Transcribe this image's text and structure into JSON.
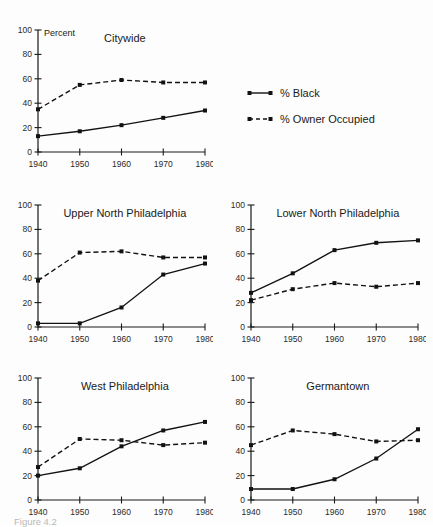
{
  "figure": {
    "caption": "Figure 4.2",
    "y_axis_name": "Percent"
  },
  "legend": {
    "position": "top-right",
    "items": [
      {
        "label": "% Black",
        "style": "solid",
        "marker": "square",
        "color": "#121212"
      },
      {
        "label": "% Owner Occupied",
        "style": "dashed",
        "marker": "square",
        "color": "#121212"
      }
    ]
  },
  "chart_data": [
    {
      "type": "line",
      "title": "Citywide",
      "xlabel": "",
      "ylabel": "Percent",
      "x": [
        1940,
        1950,
        1960,
        1970,
        1980
      ],
      "xlim": [
        1940,
        1980
      ],
      "ylim": [
        0,
        100
      ],
      "yticks": [
        0,
        20,
        40,
        60,
        80,
        100
      ],
      "xticks": [
        1940,
        1950,
        1960,
        1970,
        1980
      ],
      "grid": false,
      "series": [
        {
          "name": "% Black",
          "style": "solid",
          "values": [
            13,
            17,
            22,
            28,
            34
          ]
        },
        {
          "name": "% Owner Occupied",
          "style": "dashed",
          "values": [
            35,
            55,
            59,
            57,
            57
          ]
        }
      ]
    },
    {
      "type": "line",
      "title": "Upper North Philadelphia",
      "xlabel": "",
      "ylabel": "",
      "x": [
        1940,
        1950,
        1960,
        1970,
        1980
      ],
      "xlim": [
        1940,
        1980
      ],
      "ylim": [
        0,
        100
      ],
      "yticks": [
        0,
        20,
        40,
        60,
        80,
        100
      ],
      "xticks": [
        1940,
        1950,
        1960,
        1970,
        1980
      ],
      "grid": false,
      "series": [
        {
          "name": "% Black",
          "style": "solid",
          "values": [
            3,
            3,
            16,
            43,
            52
          ]
        },
        {
          "name": "% Owner Occupied",
          "style": "dashed",
          "values": [
            38,
            61,
            62,
            57,
            57
          ]
        }
      ]
    },
    {
      "type": "line",
      "title": "Lower North Philadelphia",
      "xlabel": "",
      "ylabel": "",
      "x": [
        1940,
        1950,
        1960,
        1970,
        1980
      ],
      "xlim": [
        1940,
        1980
      ],
      "ylim": [
        0,
        100
      ],
      "yticks": [
        0,
        20,
        40,
        60,
        80,
        100
      ],
      "xticks": [
        1940,
        1950,
        1960,
        1970,
        1980
      ],
      "grid": false,
      "series": [
        {
          "name": "% Black",
          "style": "solid",
          "values": [
            28,
            44,
            63,
            69,
            71
          ]
        },
        {
          "name": "% Owner Occupied",
          "style": "dashed",
          "values": [
            22,
            31,
            36,
            33,
            36
          ]
        }
      ]
    },
    {
      "type": "line",
      "title": "West Philadelphia",
      "xlabel": "",
      "ylabel": "",
      "x": [
        1940,
        1950,
        1960,
        1970,
        1980
      ],
      "xlim": [
        1940,
        1980
      ],
      "ylim": [
        0,
        100
      ],
      "yticks": [
        0,
        20,
        40,
        60,
        80,
        100
      ],
      "xticks": [
        1940,
        1950,
        1960,
        1970,
        1980
      ],
      "grid": false,
      "series": [
        {
          "name": "% Black",
          "style": "solid",
          "values": [
            20,
            26,
            44,
            57,
            64
          ]
        },
        {
          "name": "% Owner Occupied",
          "style": "dashed",
          "values": [
            27,
            50,
            49,
            45,
            47
          ]
        }
      ]
    },
    {
      "type": "line",
      "title": "Germantown",
      "xlabel": "",
      "ylabel": "",
      "x": [
        1940,
        1950,
        1960,
        1970,
        1980
      ],
      "xlim": [
        1940,
        1980
      ],
      "ylim": [
        0,
        100
      ],
      "yticks": [
        0,
        20,
        40,
        60,
        80,
        100
      ],
      "xticks": [
        1940,
        1950,
        1960,
        1970,
        1980
      ],
      "grid": false,
      "series": [
        {
          "name": "% Black",
          "style": "solid",
          "values": [
            9,
            9,
            17,
            34,
            58
          ]
        },
        {
          "name": "% Owner Occupied",
          "style": "dashed",
          "values": [
            45,
            57,
            54,
            48,
            49
          ]
        }
      ]
    }
  ],
  "panel_layout": [
    {
      "index": 0,
      "left": 8,
      "top": 8,
      "width": 205,
      "height": 170,
      "show_y_name": true
    },
    {
      "index": 1,
      "left": 8,
      "top": 183,
      "width": 205,
      "height": 170,
      "show_y_name": false
    },
    {
      "index": 2,
      "left": 221,
      "top": 183,
      "width": 205,
      "height": 170,
      "show_y_name": false
    },
    {
      "index": 3,
      "left": 8,
      "top": 356,
      "width": 205,
      "height": 170,
      "show_y_name": false
    },
    {
      "index": 4,
      "left": 221,
      "top": 356,
      "width": 205,
      "height": 170,
      "show_y_name": false
    }
  ]
}
